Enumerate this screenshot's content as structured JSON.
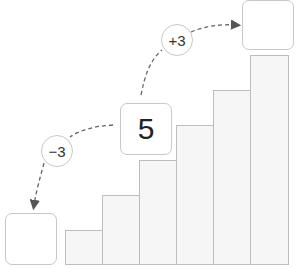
{
  "diagram": {
    "center_value": "5",
    "operations": [
      {
        "label": "+3",
        "direction": "up"
      },
      {
        "label": "−3",
        "direction": "down"
      }
    ],
    "result_boxes": [
      {
        "position": "upper-right",
        "value": ""
      },
      {
        "position": "lower-left",
        "value": ""
      }
    ],
    "staircase_bars": 6
  }
}
